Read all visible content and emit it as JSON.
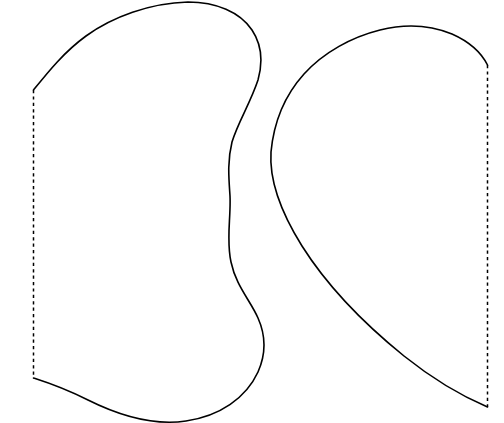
{
  "canvas": {
    "width": 504,
    "height": 423,
    "background_color": "#ffffff",
    "stroke_color": "#000000",
    "solid_stroke_width": 1.6,
    "dashed_stroke_width": 1.5,
    "dash_pattern": "3.2 3.2",
    "title": "",
    "labels": [],
    "text_present": "none"
  },
  "chart_data": {
    "type": "diagram",
    "title": "",
    "subtitle": "",
    "xlabel": "",
    "ylabel": "",
    "grid": false,
    "legend": "none",
    "xlim": [
      0,
      504
    ],
    "ylim": [
      0,
      423
    ],
    "annotations": [],
    "regions": [
      {
        "name": "left-region",
        "fill": "#ffffff",
        "outline_style": "solid",
        "closing_edge_style": "dashed",
        "closing_edge_side": "left",
        "dashed_edge": {
          "x": 33.5,
          "y_top": 90,
          "y_bottom": 378
        },
        "extreme_points": {
          "top": [
            205,
            2
          ],
          "bottom": [
            160,
            422
          ],
          "left": [
            33.5,
            234
          ],
          "right": [
            264,
            330
          ]
        },
        "solid_path": "M 33.5 90 C 48 72 64 52 86 36 C 112 17 150 3 188 2 C 216 2 240 12 252 30 C 262 45 263 62 258 80 C 250 104 238 122 232 142 C 227 162 229 180 230 196 C 231 218 226 240 231 262 C 236 286 250 300 258 318 C 266 336 266 354 258 372 C 246 398 220 416 186 421 C 152 426 116 414 88 400 C 62 387 46 382 33.5 378",
        "dashed_path": "M 33.5 90 L 33.5 378"
      },
      {
        "name": "right-region",
        "fill": "#ffffff",
        "outline_style": "solid",
        "closing_edge_style": "dashed",
        "closing_edge_side": "right",
        "dashed_edge": {
          "x": 487.5,
          "y_top": 65,
          "y_bottom": 407
        },
        "extreme_points": {
          "top": [
            406,
            26
          ],
          "bottom": [
            487.5,
            407
          ],
          "left": [
            271,
            152
          ],
          "right": [
            487.5,
            236
          ]
        },
        "solid_path": "M 487.5 65 C 482 54 470 42 452 34 C 430 25 404 24 380 30 C 352 37 324 52 304 74 C 286 94 274 120 271 152 C 269 182 282 214 302 246 C 326 284 362 322 404 356 C 434 380 464 397 487.5 407",
        "dashed_path": "M 487.5 65 L 487.5 407"
      }
    ]
  }
}
